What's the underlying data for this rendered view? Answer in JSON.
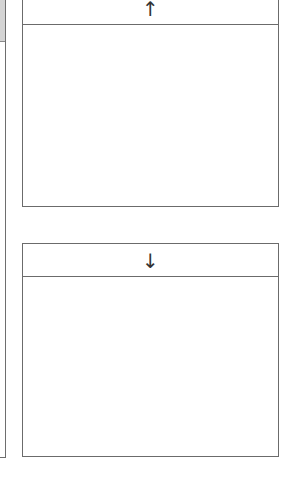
{
  "left_panel": {
    "scrollbar": {
      "thumb_position": "top"
    }
  },
  "scroll_up_box": {
    "header_icon": "arrow-up-icon",
    "header_glyph": "↑",
    "content_text": ""
  },
  "scroll_down_box": {
    "header_icon": "arrow-down-icon",
    "header_glyph": "↓",
    "content_text": ""
  },
  "colors": {
    "border": "#6b6b6b",
    "background": "#ffffff",
    "scroll_thumb": "#d4d4d4",
    "arrow": "#333333"
  }
}
